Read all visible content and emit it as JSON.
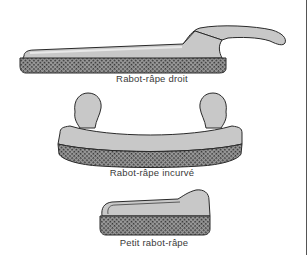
{
  "figure": {
    "items": [
      {
        "id": "straight",
        "caption": "Rabot-râpe droit"
      },
      {
        "id": "curved",
        "caption": "Rabot-râpe incurvé"
      },
      {
        "id": "small",
        "caption": "Petit rabot-râpe"
      }
    ]
  },
  "colors": {
    "body_fill": "#c8c8c8",
    "body_highlight": "#e0e0e0",
    "outline": "#2a2a2a",
    "rasp_dark": "#3a3a3a",
    "rasp_light": "#9a9a9a",
    "caption": "#3a3a3a"
  }
}
